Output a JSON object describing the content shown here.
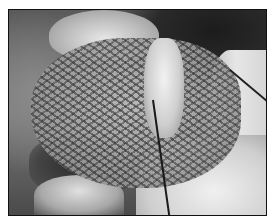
{
  "image": {
    "type": "photograph",
    "color_mode": "grayscale",
    "description": "Intraoperative photograph showing surgical mesh placed over tissue with a suture strand and surrounding tissue",
    "frame": {
      "border_color": "#111111",
      "background": "#ffffff"
    }
  }
}
